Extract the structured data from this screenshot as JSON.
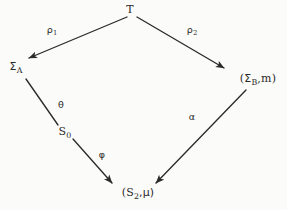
{
  "figure": {
    "kind": "commutative-diagram",
    "background_color": "#fbfbf9",
    "ink_color": "#2b2b2b",
    "width": 287,
    "height": 210
  },
  "nodes": [
    {
      "id": "T",
      "base": "T",
      "sub": "",
      "prefix": "",
      "suffix": "",
      "x": 130,
      "y": 9,
      "name": "node-t"
    },
    {
      "id": "SigmaA",
      "base": "Σ",
      "sub": "A",
      "prefix": "",
      "suffix": "",
      "x": 16,
      "y": 68,
      "name": "node-sigma-a"
    },
    {
      "id": "SigmaB_m",
      "base": "Σ",
      "sub": "B",
      "prefix": "(",
      "suffix": ",m)",
      "x": 258,
      "y": 80,
      "name": "node-sigma-b-m"
    },
    {
      "id": "S0",
      "base": "S",
      "sub": "0",
      "prefix": "",
      "suffix": "",
      "x": 65,
      "y": 133,
      "name": "node-s0"
    },
    {
      "id": "S2_mu",
      "base": "S",
      "sub": "2",
      "prefix": "(",
      "suffix": ",μ)",
      "x": 138,
      "y": 194,
      "name": "node-s2-mu"
    }
  ],
  "edges": [
    {
      "id": "rho1",
      "from": "T",
      "to": "SigmaA",
      "label_base": "ρ",
      "label_sub": "1",
      "label_x": 52,
      "label_y": 31,
      "x1": 127,
      "y1": 17,
      "x2": 29,
      "y2": 58,
      "arrowhead": true,
      "name": "edge-rho-1"
    },
    {
      "id": "rho2",
      "from": "T",
      "to": "SigmaB_m",
      "label_base": "ρ",
      "label_sub": "2",
      "label_x": 192,
      "label_y": 31,
      "x1": 137,
      "y1": 17,
      "x2": 224,
      "y2": 68,
      "arrowhead": true,
      "name": "edge-rho-2"
    },
    {
      "id": "theta",
      "from": "SigmaA",
      "to": "S0",
      "label_base": "θ",
      "label_sub": "",
      "label_x": 61,
      "label_y": 105,
      "x1": 26,
      "y1": 79,
      "x2": 58,
      "y2": 125,
      "arrowhead": false,
      "name": "edge-theta"
    },
    {
      "id": "phi",
      "from": "S0",
      "to": "S2_mu",
      "label_base": "φ",
      "label_sub": "",
      "label_x": 102,
      "label_y": 155,
      "x1": 73,
      "y1": 139,
      "x2": 112,
      "y2": 183,
      "arrowhead": true,
      "name": "edge-phi"
    },
    {
      "id": "alpha",
      "from": "SigmaB_m",
      "to": "S2_mu",
      "label_base": "α",
      "label_sub": "",
      "label_x": 192,
      "label_y": 117,
      "x1": 246,
      "y1": 90,
      "x2": 156,
      "y2": 183,
      "arrowhead": true,
      "name": "edge-alpha"
    }
  ]
}
